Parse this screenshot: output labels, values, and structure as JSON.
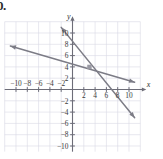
{
  "problem": {
    "label": "0."
  },
  "axes": {
    "x_axis_name": "x",
    "y_axis_name": "y",
    "x_tick_labels": [
      "-10",
      "-8",
      "-6",
      "-4",
      "-2",
      "2",
      "4",
      "6",
      "8",
      "10"
    ],
    "y_tick_labels": [
      "10",
      "8",
      "6",
      "4",
      "2",
      "-2",
      "-4",
      "-6",
      "-8",
      "-10"
    ],
    "grid_color": "#d8d8e4",
    "axis_color": "#6d6d78",
    "line_color": "#7c7c86"
  },
  "chart_data": {
    "type": "line",
    "title": "",
    "xlabel": "x",
    "ylabel": "y",
    "xlim": [
      -12,
      12
    ],
    "ylim": [
      -11,
      12
    ],
    "grid": true,
    "legend": "none",
    "xticks": [
      -10,
      -8,
      -6,
      -4,
      -2,
      2,
      4,
      6,
      8,
      10
    ],
    "yticks": [
      10,
      8,
      6,
      4,
      2,
      -2,
      -4,
      -6,
      -8,
      -10
    ],
    "tick_step": 2,
    "series": [
      {
        "name": "steep-line",
        "slope": -1.3333,
        "intercept": 8,
        "x_intercept": 6,
        "points": [
          [
            -2,
            11
          ],
          [
            0,
            8
          ],
          [
            3,
            4
          ],
          [
            6,
            0
          ],
          [
            11,
            -5
          ]
        ],
        "arrows": "both",
        "arrow_start": [
          -2,
          11
        ],
        "arrow_end": [
          11,
          -5
        ]
      },
      {
        "name": "shallow-line",
        "slope": -0.3333,
        "intercept": 5,
        "x_intercept": 15,
        "points": [
          [
            -11,
            7.7
          ],
          [
            0,
            5
          ],
          [
            3,
            4
          ],
          [
            11,
            1.3
          ]
        ],
        "arrows": "both",
        "arrow_start": [
          -11,
          7.7
        ],
        "arrow_end": [
          11,
          1.3
        ]
      }
    ],
    "intersection": {
      "label": "",
      "x": 3,
      "y": 4,
      "marked": true
    }
  }
}
